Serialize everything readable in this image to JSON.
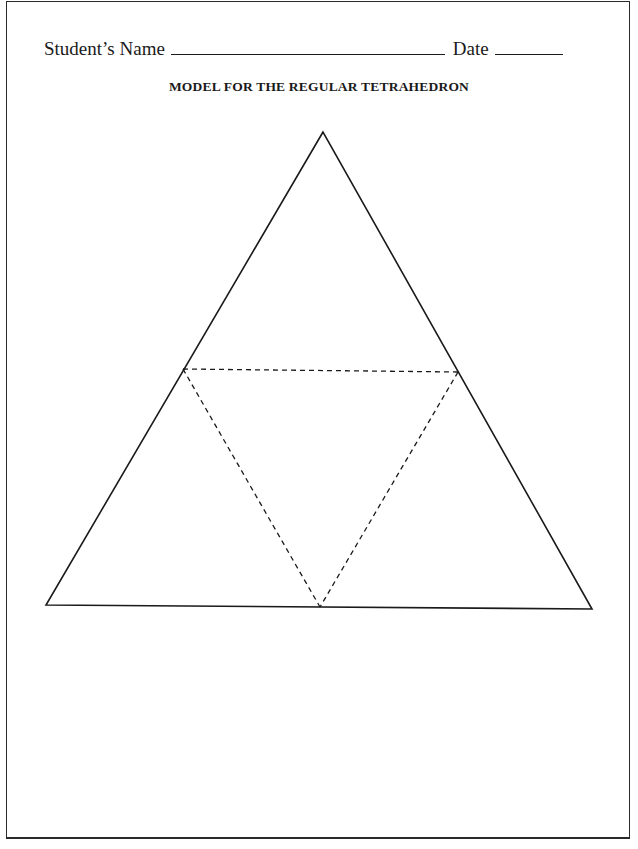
{
  "worksheet": {
    "name_label": "Student’s Name",
    "date_label": "Date",
    "title": "MODEL FOR THE REGULAR TETRAHEDRON"
  },
  "figure": {
    "shape": "equilateral triangle net",
    "outer_edges": "solid",
    "fold_lines": "dashed",
    "faces": 4
  }
}
